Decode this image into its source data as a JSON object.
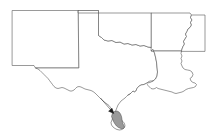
{
  "figure": {
    "type": "map",
    "title": "",
    "width": 212,
    "height": 138,
    "background_color": "#ffffff",
    "outline_color": "#555555",
    "highlight_fill_color": "#9a9a9a",
    "arrow_color": "#1a1a1a"
  },
  "states": [
    {
      "name": "new-mexico",
      "label": "",
      "path": "M 12.5 10.5 L 78.5 10.5 L 78.5 68.0 L 35.5 68.0 L 34.0 65.5 L 12.5 65.5 Z"
    },
    {
      "name": "texas",
      "label": "",
      "path": "M 78.5 10.5 L 98.5 10.5 L 98.5 13.0 L 98.5 35.5 L 101.5 37.5 L 104.0 40.0 L 108.0 41.0 L 112.0 40.5 L 116.0 42.5 L 120.0 42.0 L 124.0 44.0 L 128.0 43.5 L 132.0 45.0 L 136.0 44.5 L 140.0 46.0 L 144.0 45.5 L 148.0 47.0 L 151.5 47.5 L 153.0 49.5 L 154.5 53.0 L 155.5 57.0 L 156.5 62.0 L 157.0 67.0 L 157.5 72.0 L 157.0 76.0 L 155.5 79.0 L 153.0 81.0 L 150.0 82.5 L 147.0 83.0 L 144.0 84.5 L 141.0 85.0 L 138.5 86.5 L 137.0 88.5 L 136.0 90.5 L 134.5 92.0 L 133.0 91.0 L 131.5 92.5 L 130.0 94.0 L 128.0 95.0 L 126.5 96.5 L 125.0 98.0 L 123.0 99.5 L 121.0 101.0 L 119.5 103.0 L 118.0 105.0 L 117.0 107.5 L 116.0 110.0 L 115.0 112.5 L 114.0 115.0 L 113.0 117.5 L 112.0 120.0 L 111.0 122.5 L 111.5 125.0 L 113.0 127.0 L 115.0 128.5 L 117.0 129.5 L 119.5 130.0 L 122.0 129.5 L 124.0 128.0 L 125.0 126.0 L 124.5 123.5 L 123.0 121.5 L 121.0 120.0 L 118.5 119.0 L 116.5 117.5 L 115.0 115.0 L 113.5 112.5 L 112.0 110.0 L 110.5 107.5 L 109.0 105.5 L 107.0 104.0 L 105.0 102.5 L 103.0 101.0 L 101.0 99.0 L 99.0 97.0 L 97.0 95.0 L 95.0 93.0 L 93.0 91.5 L 91.0 90.5 L 89.0 90.0 L 87.0 89.5 L 85.0 89.0 L 83.0 88.0 L 81.0 87.0 L 79.0 86.5 L 77.0 87.0 L 75.5 88.5 L 74.0 90.0 L 72.0 91.0 L 70.0 91.0 L 68.0 90.0 L 66.0 89.0 L 64.0 88.0 L 62.0 87.5 L 60.0 88.0 L 58.0 88.5 L 56.0 88.0 L 54.0 86.5 L 52.5 84.5 L 51.0 82.5 L 49.5 80.5 L 48.0 78.5 L 46.0 76.5 L 44.0 74.5 L 42.0 72.5 L 40.0 70.5 L 38.0 69.0 L 35.5 68.0 L 78.5 68.0 Z"
    },
    {
      "name": "oklahoma",
      "label": "",
      "path": "M 78.5 10.5 L 98.5 10.5 L 98.5 13.0 L 145.0 13.0 L 145.0 13.0 L 151.5 13.0 L 151.5 47.5 L 148.0 47.0 L 144.0 45.5 L 140.0 46.0 L 136.0 44.5 L 132.0 45.0 L 128.0 43.5 L 124.0 44.0 L 120.0 42.0 L 116.0 42.5 L 112.0 40.5 L 108.0 41.0 L 104.0 40.0 L 101.5 37.5 L 98.5 35.5 L 98.5 13.0 L 78.5 13.0 Z"
    },
    {
      "name": "arkansas",
      "label": "",
      "path": "M 151.5 13.0 L 190.0 13.0 L 191.5 15.0 L 190.5 17.5 L 192.0 20.0 L 190.5 22.5 L 191.5 25.0 L 190.0 27.5 L 188.0 29.0 L 187.0 31.5 L 185.5 34.0 L 186.5 36.5 L 185.0 39.0 L 183.5 41.5 L 184.5 44.0 L 183.0 46.5 L 182.0 49.0 L 181.5 51.0 L 151.5 51.0 Z"
    },
    {
      "name": "louisiana",
      "label": "",
      "path": "M 151.5 51.0 L 181.5 51.0 L 181.0 53.5 L 182.0 56.0 L 181.0 58.5 L 182.0 61.0 L 181.0 63.5 L 182.0 66.0 L 183.0 68.0 L 185.0 69.5 L 187.5 70.0 L 190.0 70.5 L 192.0 72.0 L 193.0 74.5 L 192.0 77.0 L 190.0 78.5 L 191.0 81.0 L 193.0 82.5 L 195.0 83.0 L 196.5 84.5 L 195.5 86.5 L 193.5 87.5 L 191.0 88.0 L 188.5 88.5 L 186.0 89.5 L 184.0 91.0 L 182.0 92.0 L 180.0 92.5 L 178.0 93.0 L 176.0 93.5 L 174.0 93.0 L 172.0 92.0 L 170.0 91.5 L 168.0 91.0 L 166.0 90.5 L 164.0 90.0 L 162.0 89.5 L 160.0 89.0 L 158.0 88.5 L 156.5 87.5 L 155.0 88.5 L 153.0 89.0 L 151.0 88.5 L 149.5 87.0 L 148.0 85.5 L 147.0 84.0 L 148.0 82.0 L 150.0 81.0 L 153.0 81.0 L 155.5 79.0 L 157.0 76.0 L 157.5 72.0 L 157.0 67.0 L 156.5 62.0 L 155.5 57.0 L 154.5 53.0 L 153.0 49.5 Z"
    },
    {
      "name": "mississippi",
      "label": "",
      "path": "M 181.5 51.0 L 182.0 49.0 L 183.0 46.5 L 184.5 44.0 L 183.5 41.5 L 185.0 39.0 L 186.5 36.5 L 185.5 34.0 L 187.0 31.5 L 188.0 29.0 L 190.0 27.5 L 191.5 25.0 L 190.5 22.5 L 192.0 20.0 L 190.5 17.5 L 191.5 15.0 L 205.0 15.0 L 205.0 51.0 Z"
    }
  ],
  "coastline": {
    "name": "gulf-coastline",
    "label": "",
    "path": "M 128.0 95.0 L 130.0 94.0 L 131.5 92.5 L 133.0 91.0 L 134.5 92.0 L 136.0 90.5 L 137.0 88.5 L 138.5 86.5 L 141.0 85.0 L 144.0 84.5 L 147.0 83.0 L 150.0 82.5 L 153.0 81.0"
  },
  "highlight": {
    "name": "study-area",
    "label": "",
    "region_description": "shaded area, lower Texas Gulf coast",
    "path": "M 112.5 113.0 L 114.5 111.5 L 117.0 111.0 L 119.0 112.0 L 120.5 114.0 L 121.5 116.5 L 122.0 119.5 L 122.5 122.5 L 123.5 125.0 L 124.5 127.0 L 123.5 128.5 L 121.0 128.5 L 118.5 127.5 L 116.5 126.0 L 115.0 124.0 L 113.5 121.5 L 112.5 119.0 L 111.5 116.5 Z"
  },
  "arrow": {
    "name": "location-pointer",
    "label": "",
    "shaft_path": "M 100.5 98.0 L 113.0 112.5",
    "head_path": "M 113.8 113.5 L 108.6 111.2 L 112.0 108.2 Z",
    "tip_x": 114,
    "tip_y": 114
  }
}
